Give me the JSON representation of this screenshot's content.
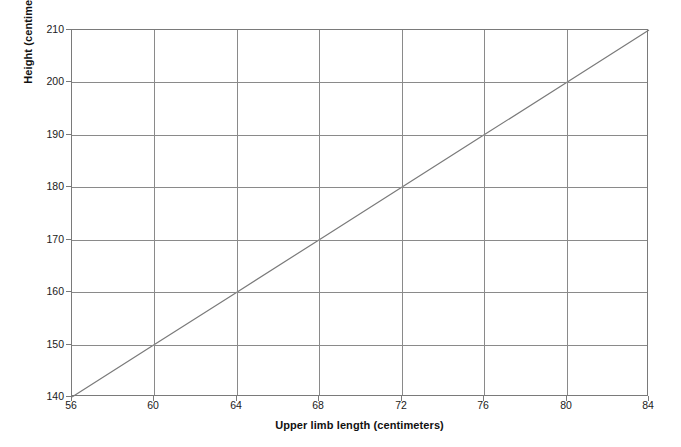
{
  "chart_data": {
    "type": "line",
    "title": "",
    "subtitle": "",
    "xlabel": "Upper limb length (centimeters)",
    "ylabel": "Height (centimeters)",
    "xlim": [
      56,
      84
    ],
    "ylim": [
      140,
      210
    ],
    "xticks": [
      56,
      60,
      64,
      68,
      72,
      76,
      80,
      84
    ],
    "yticks": [
      140,
      150,
      160,
      170,
      180,
      190,
      200,
      210
    ],
    "xtick_labels": [
      "56",
      "60",
      "64",
      "68",
      "72",
      "76",
      "80",
      "84"
    ],
    "ytick_labels": [
      "140",
      "150",
      "160",
      "170",
      "180",
      "190",
      "200",
      "210"
    ],
    "grid": true,
    "legend": "none",
    "annotations": [],
    "series": [
      {
        "name": "Height vs upper limb length",
        "color": "#7a7a7a",
        "line_width": 1.2,
        "x": [
          56,
          60,
          64,
          68,
          72,
          76,
          80,
          84
        ],
        "y": [
          140,
          150,
          160,
          170,
          180,
          190,
          200,
          210
        ]
      }
    ],
    "relationship": {
      "slope": 2.5,
      "intercept": 0,
      "description": "height = 2.5 x upper limb length"
    }
  },
  "style": {
    "background": "#ffffff",
    "grid_color": "#8a8a8a",
    "axis_color": "#7a7a7a",
    "line_color": "#7a7a7a",
    "text_color": "#1a1a1a"
  }
}
